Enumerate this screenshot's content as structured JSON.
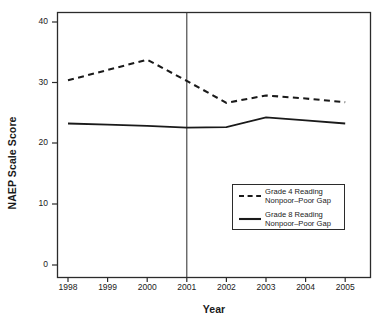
{
  "chart_data": {
    "type": "line",
    "title": "",
    "xlabel": "Year",
    "ylabel": "NAEP Scale Score",
    "x": [
      1998,
      1999,
      2000,
      2001,
      2002,
      2003,
      2004,
      2005
    ],
    "xtick_labels": [
      "1998",
      "1999",
      "2000",
      "2001",
      "2002",
      "2003",
      "2004",
      "2005"
    ],
    "ytick_labels": [
      "0",
      "10",
      "20",
      "30",
      "40"
    ],
    "ytick_values": [
      0,
      10,
      20,
      30,
      40
    ],
    "xlim": [
      1997.5,
      2005.5
    ],
    "ylim": [
      -1.5,
      42
    ],
    "grid": false,
    "legend_position": "inside-lower-right",
    "annotations": [
      {
        "name": "reference-line",
        "type": "vline",
        "x": 2001
      }
    ],
    "series": [
      {
        "name": "Grade 4 Reading Nonpoor–Poor Gap",
        "style": "dashed",
        "color": "#1a1a1a",
        "x": [
          1998,
          1999,
          2000,
          2001,
          2002,
          2003,
          2004,
          2005
        ],
        "values": [
          30.4,
          32.1,
          33.8,
          30.3,
          26.7,
          27.9,
          27.4,
          26.8
        ]
      },
      {
        "name": "Grade 8 Reading Nonpoor–Poor Gap",
        "style": "solid",
        "color": "#1a1a1a",
        "x": [
          1998,
          1999,
          2000,
          2001,
          2002,
          2003,
          2004,
          2005
        ],
        "values": [
          23.3,
          23.1,
          22.9,
          22.6,
          22.7,
          24.3,
          23.8,
          23.3
        ]
      }
    ]
  },
  "legend": {
    "entries": [
      {
        "line1": "Grade 4 Reading",
        "line2": "Nonpoor–Poor Gap",
        "style": "dashed"
      },
      {
        "line1": "Grade 8 Reading",
        "line2": "Nonpoor–Poor Gap",
        "style": "solid"
      }
    ]
  },
  "colors": {
    "line": "#1a1a1a",
    "frame": "#2b2b2b",
    "background": "#ffffff"
  }
}
